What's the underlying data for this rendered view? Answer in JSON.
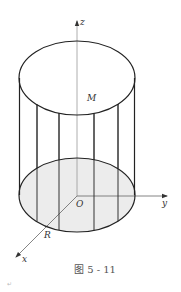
{
  "figure": {
    "caption": "图 5 - 11",
    "paragraph_mark": "↵",
    "labels": {
      "z_axis": "z",
      "y_axis": "y",
      "x_axis": "x",
      "origin": "O",
      "radius": "R",
      "point": "M"
    },
    "colors": {
      "outline": "#222222",
      "axis": "#888888",
      "base_fill": "#ececec",
      "background": "#ffffff"
    },
    "cylinder": {
      "center_x": 77,
      "top_center_y": 78,
      "bottom_center_y": 195,
      "rx": 58,
      "ry": 37,
      "generator_lines_x": [
        37,
        59,
        94,
        118
      ]
    }
  }
}
